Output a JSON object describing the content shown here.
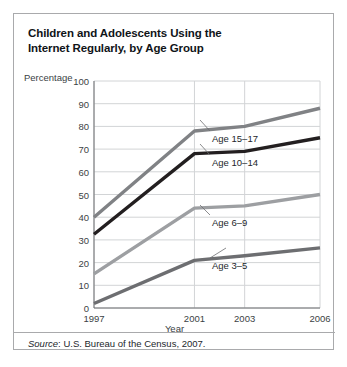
{
  "figure": {
    "title": "Children and Adolescents Using the\nInternet Regularly, by Age Group",
    "title_line1": "Children and Adolescents Using the",
    "title_line2": "Internet Regularly, by Age Group",
    "source_prefix": "Source",
    "source_separator": ": ",
    "source_text": "U.S. Bureau of the Census, 2007.",
    "border_color": "#a9aaac",
    "background_color": "#ffffff"
  },
  "chart_data": {
    "type": "line",
    "title": "Children and Adolescents Using the Internet Regularly, by Age Group",
    "xlabel": "Year",
    "ylabel": "Percentage",
    "x": [
      1997,
      2001,
      2003,
      2006
    ],
    "categories": [
      "1997",
      "2001",
      "2003",
      "2006"
    ],
    "xtick_labels": [
      "1997",
      "2001",
      "2003",
      "2006"
    ],
    "ytick_labels": [
      "0",
      "10",
      "20",
      "30",
      "40",
      "50",
      "60",
      "70",
      "80",
      "90",
      "100"
    ],
    "ylim": [
      0,
      100
    ],
    "ytick_step": 10,
    "grid": true,
    "grid_color": "#d2d4d6",
    "legend": "inline-labels",
    "series": [
      {
        "name": "Age 15–17",
        "label": "Age 15–17",
        "values": [
          40,
          78,
          80,
          88
        ],
        "color": "#808285"
      },
      {
        "name": "Age 10–14",
        "label": "Age 10–14",
        "values": [
          32.5,
          68,
          69,
          75
        ],
        "color": "#231f20"
      },
      {
        "name": "Age 6–9",
        "label": "Age 6–9",
        "values": [
          15,
          44,
          45,
          50
        ],
        "color": "#9d9fa2"
      },
      {
        "name": "Age 3–5",
        "label": "Age 3–5",
        "values": [
          2,
          21,
          23,
          26.5
        ],
        "color": "#6d6e71"
      }
    ]
  }
}
